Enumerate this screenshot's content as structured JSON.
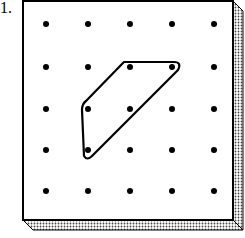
{
  "problem": {
    "number_label": "1."
  },
  "geoboard": {
    "rows": 5,
    "cols": 5,
    "board_color": "#ffffff",
    "edge_color": "#000000",
    "peg_color": "#000000",
    "shape": {
      "description": "quadrilateral (trapezoid) formed by a rubber band",
      "vertices_grid": [
        [
          2,
          1
        ],
        [
          4,
          1
        ],
        [
          1,
          4
        ],
        [
          1,
          2
        ]
      ]
    }
  }
}
